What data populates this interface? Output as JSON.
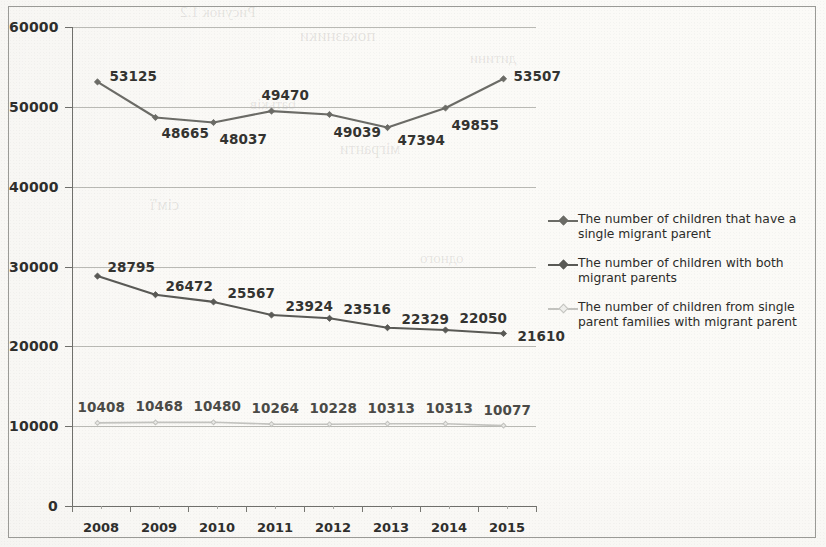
{
  "chart_data": {
    "type": "line",
    "title": "",
    "subtitle": "",
    "xlabel": "",
    "ylabel": "",
    "categories": [
      "2008",
      "2009",
      "2010",
      "2011",
      "2012",
      "2013",
      "2014",
      "2015"
    ],
    "ylim": [
      0,
      60000
    ],
    "ytick_labels": [
      "60000",
      "50000",
      "40000",
      "30000",
      "20000",
      "10000",
      "0"
    ],
    "ytick_values": [
      60000,
      50000,
      40000,
      30000,
      20000,
      10000,
      0
    ],
    "grid": "horizontal",
    "legend_position": "right",
    "series": [
      {
        "name": "The number of children that have a single migrant parent",
        "color": "#6b6b66",
        "marker": "diamond",
        "values": [
          53125,
          48665,
          48037,
          49470,
          49039,
          47394,
          49855,
          53507
        ],
        "labels": [
          "53125",
          "48665",
          "48037",
          "49470",
          "49039",
          "47394",
          "49855",
          "53507"
        ]
      },
      {
        "name": "The number of children with both migrant parents",
        "color": "#595955",
        "marker": "diamond",
        "values": [
          28795,
          26472,
          25567,
          23924,
          23516,
          22329,
          22050,
          21610
        ],
        "labels": [
          "28795",
          "26472",
          "25567",
          "23924",
          "23516",
          "22329",
          "22050",
          "21610"
        ]
      },
      {
        "name": "The number of children from single parent families with migrant parent",
        "color": "#c3c3bf",
        "marker": "diamond-open",
        "values": [
          10408,
          10468,
          10480,
          10264,
          10228,
          10313,
          10313,
          10077
        ],
        "labels": [
          "10408",
          "10468",
          "10480",
          "10264",
          "10228",
          "10313",
          "10313",
          "10077"
        ]
      }
    ]
  },
  "legend": {
    "items": [
      {
        "label": "The number of children that have a single migrant parent",
        "color": "#6b6b66"
      },
      {
        "label": "The number of children with both migrant parents",
        "color": "#595955"
      },
      {
        "label": "The number of children from single parent families with migrant parent",
        "color": "#c3c3bf"
      }
    ]
  },
  "ghost_text": {
    "a": "показники",
    "b": "дитини",
    "c": "батьків",
    "d": "мігранти",
    "e": "сім'ї",
    "f": "Рисунок 1.2",
    "g": "одного"
  }
}
